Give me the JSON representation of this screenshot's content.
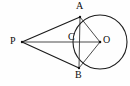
{
  "figure": {
    "background_color": "#fefefe",
    "stroke_color": "#1a1a1a",
    "width": 130,
    "height": 86
  },
  "points": {
    "P": {
      "label": "P",
      "x": 22,
      "y": 42,
      "label_x": 10,
      "label_y": 36
    },
    "A": {
      "label": "A",
      "x": 80,
      "y": 17,
      "label_x": 76,
      "label_y": 1
    },
    "B": {
      "label": "B",
      "x": 79,
      "y": 68,
      "label_x": 75,
      "label_y": 70
    },
    "C": {
      "label": "C",
      "x": 79,
      "y": 42,
      "label_x": 68,
      "label_y": 32
    },
    "O": {
      "label": "O",
      "x": 100,
      "y": 42,
      "label_x": 103,
      "label_y": 35
    }
  },
  "circle": {
    "center_x": 100,
    "center_y": 42,
    "radius": 27,
    "name": "circle-O"
  },
  "segments": [
    {
      "name": "segment-PA",
      "from": "P",
      "to": "A",
      "weight": "thick"
    },
    {
      "name": "segment-PB",
      "from": "P",
      "to": "B",
      "weight": "thick"
    },
    {
      "name": "segment-PO",
      "from": "P",
      "to": "O",
      "weight": "thin"
    },
    {
      "name": "segment-AB",
      "from": "A",
      "to": "B",
      "weight": "thin"
    },
    {
      "name": "segment-AO",
      "from": "A",
      "to": "O",
      "weight": "thin"
    },
    {
      "name": "segment-BO",
      "from": "B",
      "to": "O",
      "weight": "thin"
    }
  ]
}
